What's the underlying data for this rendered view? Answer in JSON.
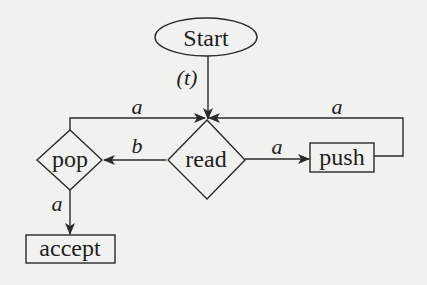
{
  "diagram": {
    "type": "flowchart",
    "colors": {
      "background": "#f1f1f0",
      "stroke": "#2a2a2a",
      "text": "#1e1e1e"
    },
    "nodes": [
      {
        "id": "start",
        "label": "Start",
        "shape": "ellipse"
      },
      {
        "id": "read",
        "label": "read",
        "shape": "diamond"
      },
      {
        "id": "pop",
        "label": "pop",
        "shape": "diamond"
      },
      {
        "id": "push",
        "label": "push",
        "shape": "rectangle"
      },
      {
        "id": "accept",
        "label": "accept",
        "shape": "rectangle"
      }
    ],
    "edges": [
      {
        "from": "start",
        "to": "read",
        "label": "(t)"
      },
      {
        "from": "read",
        "to": "pop",
        "label": "b"
      },
      {
        "from": "read",
        "to": "push",
        "label": "a"
      },
      {
        "from": "push",
        "to": "read",
        "label": "a"
      },
      {
        "from": "pop",
        "to": "read",
        "label": "a"
      },
      {
        "from": "pop",
        "to": "accept",
        "label": "a"
      }
    ]
  }
}
